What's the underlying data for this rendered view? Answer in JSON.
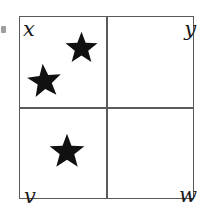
{
  "figure": {
    "type": "2x2-grid-diagram",
    "background_color": "#ffffff",
    "line_color": "#5a5a5a",
    "star_color": "#111111",
    "label_color": "#1c1c1c",
    "box": {
      "x": 19,
      "y": 16,
      "width": 175,
      "height": 183
    },
    "dividers": {
      "vertical_x": 106,
      "horizontal_y": 107
    },
    "labels": [
      {
        "id": "x",
        "text": "x",
        "corner": "top-left"
      },
      {
        "id": "y",
        "text": "y",
        "corner": "top-right"
      },
      {
        "id": "v",
        "text": "v",
        "corner": "bottom-left"
      },
      {
        "id": "w",
        "text": "w",
        "corner": "bottom-right"
      }
    ],
    "stars": [
      {
        "id": "star-1",
        "cell": "top-left",
        "x": 64,
        "y": 31,
        "size": 35,
        "rotation": 0
      },
      {
        "id": "star-2",
        "cell": "top-left",
        "x": 26,
        "y": 63,
        "size": 37,
        "rotation": -6
      },
      {
        "id": "star-3",
        "cell": "bottom-left",
        "x": 48,
        "y": 133,
        "size": 38,
        "rotation": 0
      }
    ],
    "star_counts": {
      "top_left": 2,
      "top_right": 0,
      "bottom_left": 1,
      "bottom_right": 0
    },
    "artifact": {
      "id": "edge-mark",
      "x": 1,
      "y": 26,
      "width": 5,
      "height": 7
    }
  }
}
